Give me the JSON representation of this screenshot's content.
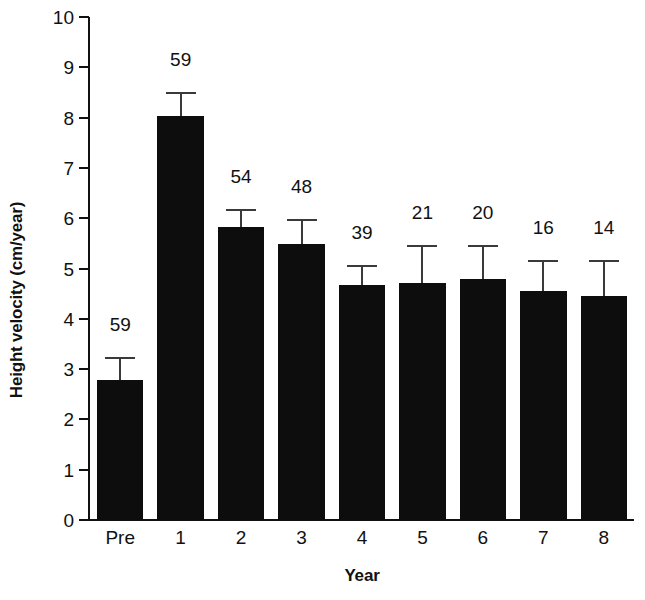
{
  "chart_data": {
    "type": "bar",
    "title": "",
    "xlabel": "Year",
    "ylabel": "Height velocity (cm/year)",
    "categories": [
      "Pre",
      "1",
      "2",
      "3",
      "4",
      "5",
      "6",
      "7",
      "8"
    ],
    "values": [
      2.78,
      8.03,
      5.82,
      5.48,
      4.68,
      4.72,
      4.8,
      4.55,
      4.45
    ],
    "errors_upper": [
      0.42,
      0.43,
      0.33,
      0.47,
      0.35,
      0.7,
      0.62,
      0.58,
      0.68
    ],
    "point_labels": [
      "59",
      "59",
      "54",
      "48",
      "39",
      "21",
      "20",
      "16",
      "14"
    ],
    "ylim": [
      0,
      10
    ],
    "yticks": [
      0,
      1,
      2,
      3,
      4,
      5,
      6,
      7,
      8,
      9,
      10
    ],
    "ytick_labels": [
      "0",
      "1",
      "2",
      "3",
      "4",
      "5",
      "6",
      "7",
      "8",
      "9",
      "10"
    ],
    "grid": false,
    "legend": null,
    "bar_color": "#0d0d0d",
    "errorbar_color": "#3a3a3a",
    "axis_color": "#111111"
  }
}
